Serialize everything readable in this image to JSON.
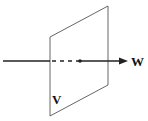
{
  "diagram": {
    "plane_label": "V",
    "vector_label": "W",
    "line_color": "#222222",
    "plane_color": "#555555"
  }
}
